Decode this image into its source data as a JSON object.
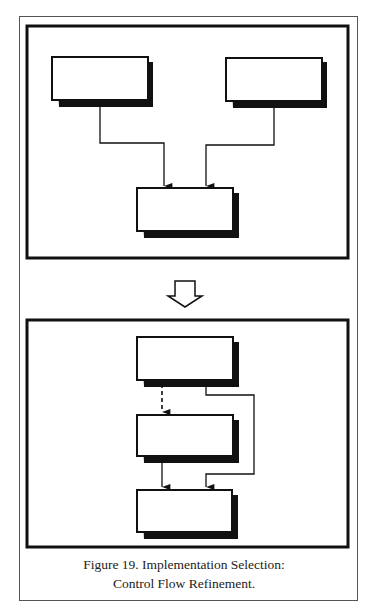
{
  "figure": {
    "number": "19",
    "caption_line1": "Figure 19. Implementation Selection:",
    "caption_line2": "Control Flow Refinement."
  },
  "top_panel": {
    "description": "Two unlabeled blocks each feeding a solid control-flow arrow into a single lower block",
    "blocks": [
      {
        "id": "top-left",
        "label": ""
      },
      {
        "id": "top-right",
        "label": ""
      },
      {
        "id": "bottom-center",
        "label": ""
      }
    ],
    "edges": [
      {
        "from": "top-left",
        "to": "bottom-center",
        "style": "solid"
      },
      {
        "from": "top-right",
        "to": "bottom-center",
        "style": "solid"
      }
    ]
  },
  "transition_arrow": {
    "icon": "hollow-down-arrow"
  },
  "bottom_panel": {
    "description": "Refined sequential chain with a dashed arrow and a bypass edge",
    "blocks": [
      {
        "id": "upper",
        "label": ""
      },
      {
        "id": "middle",
        "label": ""
      },
      {
        "id": "lower",
        "label": ""
      }
    ],
    "edges": [
      {
        "from": "upper",
        "to": "middle",
        "style": "dashed"
      },
      {
        "from": "middle",
        "to": "lower",
        "style": "solid"
      },
      {
        "from": "upper",
        "to": "lower",
        "style": "solid",
        "route": "bypass-right"
      }
    ]
  },
  "colors": {
    "ink": "#111111",
    "frame": "#555555",
    "background": "#ffffff"
  }
}
